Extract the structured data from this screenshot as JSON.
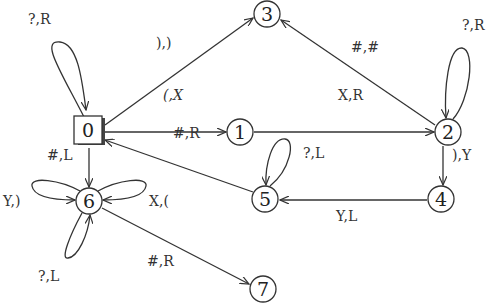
{
  "diagram": {
    "type": "state-machine",
    "nodes": [
      {
        "id": "0",
        "label": "0",
        "shape": "box",
        "x": 89,
        "y": 132
      },
      {
        "id": "1",
        "label": "1",
        "shape": "circle",
        "x": 240,
        "y": 132
      },
      {
        "id": "2",
        "label": "2",
        "shape": "circle",
        "x": 448,
        "y": 132
      },
      {
        "id": "3",
        "label": "3",
        "shape": "circle",
        "x": 267,
        "y": 14
      },
      {
        "id": "4",
        "label": "4",
        "shape": "circle",
        "x": 441,
        "y": 199
      },
      {
        "id": "5",
        "label": "5",
        "shape": "circle",
        "x": 265,
        "y": 199
      },
      {
        "id": "6",
        "label": "6",
        "shape": "circle",
        "x": 89,
        "y": 201
      },
      {
        "id": "7",
        "label": "7",
        "shape": "circle",
        "x": 263,
        "y": 289
      }
    ],
    "edges": [
      {
        "from": "0",
        "to": "0",
        "label": "?,R"
      },
      {
        "from": "0",
        "to": "3",
        "label": "),)"
      },
      {
        "from": "0",
        "to": "1",
        "label": "(,X"
      },
      {
        "from": "1",
        "to": "2",
        "label": "X,R"
      },
      {
        "from": "2",
        "to": "3",
        "label": "#,#"
      },
      {
        "from": "2",
        "to": "2",
        "label": "?,R"
      },
      {
        "from": "2",
        "to": "4",
        "label": "),Y"
      },
      {
        "from": "4",
        "to": "5",
        "label": "Y,L"
      },
      {
        "from": "5",
        "to": "5",
        "label": "?,L"
      },
      {
        "from": "5",
        "to": "0",
        "label": "#,R"
      },
      {
        "from": "0",
        "to": "6",
        "label": "#,L"
      },
      {
        "from": "6",
        "to": "6",
        "label": "Y,)",
        "position": "left"
      },
      {
        "from": "6",
        "to": "6",
        "label": "X,(",
        "position": "right"
      },
      {
        "from": "6",
        "to": "6",
        "label": "?,L",
        "position": "bottom"
      },
      {
        "from": "6",
        "to": "7",
        "label": "#,R"
      }
    ]
  }
}
